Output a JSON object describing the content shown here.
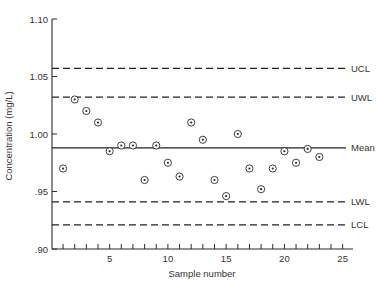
{
  "chart_data": {
    "type": "scatter",
    "title": "",
    "xlabel": "Sample number",
    "ylabel": "Concentration (mg/L)",
    "xlim": [
      0,
      26
    ],
    "ylim": [
      0.9,
      1.1
    ],
    "x_ticks": [
      5,
      10,
      15,
      20,
      25
    ],
    "x_minor_ticks": [
      1,
      2,
      3,
      4,
      5,
      6,
      7,
      8,
      9,
      10,
      11,
      12,
      13,
      14,
      15,
      16,
      17,
      18,
      19,
      20,
      21,
      22,
      23,
      24,
      25
    ],
    "y_ticks": [
      {
        "value": 0.9,
        "label": ".90"
      },
      {
        "value": 0.95,
        "label": ".95"
      },
      {
        "value": 1.0,
        "label": "1.00"
      },
      {
        "value": 1.05,
        "label": "1.05"
      },
      {
        "value": 1.1,
        "label": "1.10"
      }
    ],
    "grid": false,
    "reference_lines": [
      {
        "name": "UCL",
        "value": 1.057,
        "style": "dashed"
      },
      {
        "name": "UWL",
        "value": 1.032,
        "style": "dashed"
      },
      {
        "name": "Mean",
        "value": 0.988,
        "style": "solid"
      },
      {
        "name": "LWL",
        "value": 0.941,
        "style": "dashed"
      },
      {
        "name": "LCL",
        "value": 0.921,
        "style": "dashed"
      }
    ],
    "series": [
      {
        "name": "Samples",
        "marker": "circled-dot",
        "x": [
          1,
          2,
          3,
          4,
          5,
          6,
          7,
          8,
          9,
          10,
          11,
          12,
          13,
          14,
          15,
          16,
          17,
          18,
          19,
          20,
          21,
          22,
          23
        ],
        "y": [
          0.97,
          1.03,
          1.02,
          1.01,
          0.985,
          0.99,
          0.99,
          0.96,
          0.99,
          0.975,
          0.963,
          1.01,
          0.995,
          0.96,
          0.946,
          1.0,
          0.97,
          0.952,
          0.97,
          0.985,
          0.975,
          0.987,
          0.98
        ]
      }
    ]
  },
  "colors": {
    "axis": "#2a2a2a",
    "line": "#222222",
    "marker": "#2a2a2a"
  }
}
